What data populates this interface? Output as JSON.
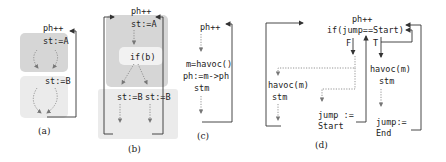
{
  "panels": [
    {
      "id": "a",
      "caption": "(a)",
      "labels": {
        "ph": "ph++",
        "st1": "st:=A",
        "st2": "st:=B"
      }
    },
    {
      "id": "b",
      "caption": "(b)",
      "labels": {
        "ph": "ph++",
        "st1": "st:=A",
        "cond": "if(b)",
        "st2": "st:=B",
        "st3": "st:=B"
      }
    },
    {
      "id": "c",
      "caption": "(c)",
      "labels": {
        "ph": "ph++",
        "havoc": "m=havoc()",
        "assign": "ph:=m->ph",
        "stm": "stm"
      }
    },
    {
      "id": "d",
      "caption": "(d)",
      "labels": {
        "ph": "ph++",
        "cond": "if(jump==Start)",
        "false_label": "F",
        "true_label": "T",
        "left_havoc": "havoc(m)",
        "left_stm": "stm",
        "jump_start_1": "jump :=",
        "jump_start_2": "Start",
        "right_havoc": "havoc(m)",
        "right_stm": "stm",
        "jump_end_1": "jump:=",
        "jump_end_2": "End"
      }
    }
  ],
  "colors": {
    "region_dark": "#d6d6d6",
    "region_light": "#ebebeb",
    "region_white": "#f7f7f7"
  }
}
